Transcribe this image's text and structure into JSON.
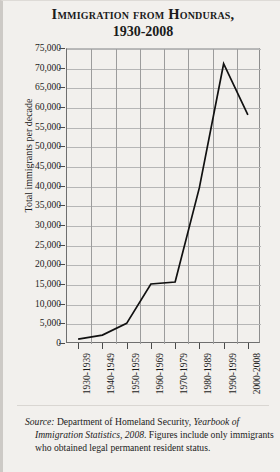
{
  "title": {
    "line1": "Immigration from Honduras,",
    "line2": "1930-2008"
  },
  "source": {
    "label": "Source:",
    "text_part1": " Department of Homeland Security, ",
    "italic_work": "Yearbook of Immigration Statistics, 2008",
    "text_part2": ". Figures include only immigrants who obtained legal permanent resident status."
  },
  "chart_data": {
    "type": "line",
    "title": "Immigration from Honduras, 1930-2008",
    "xlabel": "",
    "ylabel": "Total immigrants per decade",
    "categories": [
      "1930-1939",
      "1940-1949",
      "1950-1959",
      "1960-1969",
      "1970-1979",
      "1980-1989",
      "1990-1999",
      "2000-2008"
    ],
    "values": [
      1000,
      2000,
      5000,
      15000,
      15500,
      39500,
      71000,
      58000
    ],
    "ylim": [
      0,
      75000
    ],
    "ytick_step": 5000,
    "yticks": [
      "75,000",
      "70,000",
      "65,000",
      "60,000",
      "55,000",
      "50,000",
      "45,000",
      "40,000",
      "35,000",
      "30,000",
      "25,000",
      "20,000",
      "15,000",
      "10,000",
      "5,000",
      "0"
    ],
    "ytick_values": [
      75000,
      70000,
      65000,
      60000,
      55000,
      50000,
      45000,
      40000,
      35000,
      30000,
      25000,
      20000,
      15000,
      10000,
      5000,
      0
    ],
    "grid": true,
    "legend": false,
    "line_color": "#111111",
    "grid_color": "#b6b6b6",
    "background": "#f2f0ed"
  }
}
